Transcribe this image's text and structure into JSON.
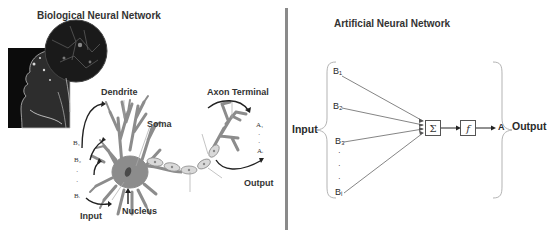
{
  "biological": {
    "title": "Biological Neural Network",
    "labels": {
      "dendrite": "Dendrite",
      "soma": "Soma",
      "axon_terminal": "Axon Terminal",
      "nucleus": "Nucleus",
      "input": "Input",
      "output": "Output"
    },
    "inputs": [
      "B₁",
      "B₂",
      "·",
      "·",
      "Bᵢ"
    ],
    "outputs": [
      "A₁",
      "·",
      "·",
      "Aᵢ"
    ]
  },
  "artificial": {
    "title": "Artificial Neural Network",
    "input_label": "Input",
    "output_label": "Output",
    "inputs": [
      "B₁",
      "B₂",
      "B₃",
      "·",
      "·",
      "·",
      "Bᵢ"
    ],
    "sum_symbol": "Σ",
    "activation_symbol": "f",
    "output_symbol": "A"
  },
  "colors": {
    "divider": "#8a8a8a",
    "neuron": "#8c8c8c",
    "lines": "#777777",
    "text": "#2a2a2a"
  }
}
